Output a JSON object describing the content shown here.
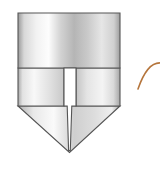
{
  "canvas": {
    "width": 160,
    "height": 176,
    "background_color": "#FFFFFF"
  },
  "figure": {
    "name": "shield-shaped-metal-fixture",
    "outline_color": "#555555",
    "outline_width": 1.1,
    "slot_fill_color": "#FFFFFF",
    "parts": [
      {
        "name": "upper-rectangular-body",
        "label": "upper body",
        "bounds": {
          "x": 18,
          "y": 13,
          "width": 102,
          "height": 55
        },
        "gradient": {
          "type": "linear-horizontal",
          "stops": [
            {
              "offset": "0%",
              "color": "#9A9A9A"
            },
            {
              "offset": "6%",
              "color": "#D8D8D8"
            },
            {
              "offset": "18%",
              "color": "#F2F2F2"
            },
            {
              "offset": "30%",
              "color": "#FDFDFD"
            },
            {
              "offset": "42%",
              "color": "#D2D2D2"
            },
            {
              "offset": "55%",
              "color": "#B5B5B5"
            },
            {
              "offset": "68%",
              "color": "#C9C9C9"
            },
            {
              "offset": "82%",
              "color": "#E6E6E6"
            },
            {
              "offset": "94%",
              "color": "#D0D0D0"
            },
            {
              "offset": "100%",
              "color": "#9E9E9E"
            }
          ]
        }
      },
      {
        "name": "middle-band-left",
        "label": "middle band left segment",
        "bounds": {
          "x": 18,
          "y": 68,
          "width": 46,
          "height": 38
        },
        "gradient": {
          "type": "linear-horizontal",
          "stops": [
            {
              "offset": "0%",
              "color": "#A8A8A8"
            },
            {
              "offset": "10%",
              "color": "#E2E2E2"
            },
            {
              "offset": "35%",
              "color": "#F8F8F8"
            },
            {
              "offset": "70%",
              "color": "#E0E0E0"
            },
            {
              "offset": "100%",
              "color": "#C8C8C8"
            }
          ]
        }
      },
      {
        "name": "middle-band-right",
        "label": "middle band right segment",
        "bounds": {
          "x": 76,
          "y": 68,
          "width": 44,
          "height": 38
        },
        "gradient": {
          "type": "linear-horizontal",
          "stops": [
            {
              "offset": "0%",
              "color": "#C4C4C4"
            },
            {
              "offset": "25%",
              "color": "#E4E4E4"
            },
            {
              "offset": "60%",
              "color": "#F4F4F4"
            },
            {
              "offset": "85%",
              "color": "#DADADA"
            },
            {
              "offset": "100%",
              "color": "#A6A6A6"
            }
          ]
        }
      },
      {
        "name": "lower-v-point",
        "label": "lower V shaped point",
        "apex": {
          "x": 69,
          "y": 152
        },
        "gradient": {
          "type": "linear-horizontal",
          "stops": [
            {
              "offset": "0%",
              "color": "#B0B0B0"
            },
            {
              "offset": "15%",
              "color": "#E8E8E8"
            },
            {
              "offset": "35%",
              "color": "#FAFAFA"
            },
            {
              "offset": "55%",
              "color": "#CFCFCF"
            },
            {
              "offset": "75%",
              "color": "#DDDDDD"
            },
            {
              "offset": "92%",
              "color": "#EFEFEF"
            },
            {
              "offset": "100%",
              "color": "#A8A8A8"
            }
          ]
        }
      },
      {
        "name": "vertical-slot",
        "label": "central vertical slot",
        "upper_width": 12,
        "lower_width": 5,
        "top_y": 68,
        "bottom_y": 152,
        "fill": "#FFFFFF"
      }
    ]
  },
  "annotation_arc": {
    "name": "leader-arc",
    "label": "curved leader line",
    "color": "#B5753C",
    "stroke_width": 1.6,
    "start": {
      "x": 138,
      "y": 89
    },
    "control": {
      "x": 147,
      "y": 62
    },
    "end": {
      "x": 160,
      "y": 63
    }
  }
}
